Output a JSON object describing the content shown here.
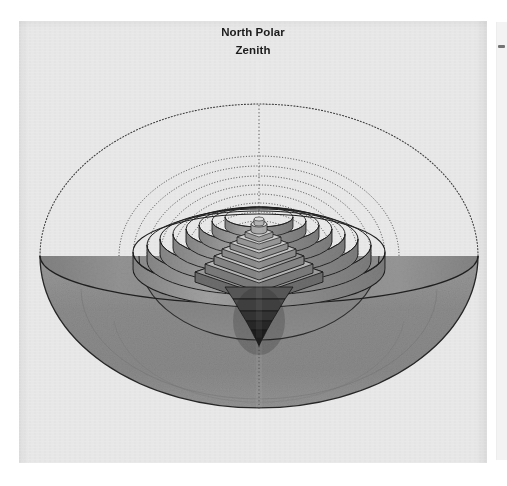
{
  "document": {
    "kind": "scanned-book-page",
    "page_background": "#e9e9e9",
    "ink_color": "#1c1c1c",
    "gutter_color": "#ffffff"
  },
  "caption": {
    "line1": "North Polar",
    "line2": "Zenith"
  },
  "figure": {
    "name": "north-polar-zenith-cosmological-diagram",
    "center_x": 240,
    "horizon_y": 235,
    "outer_sphere": {
      "rx": 219,
      "ry": 152,
      "stroke": "#2a2a2a",
      "style": "dotted",
      "label": "outer celestial sphere"
    },
    "horizon_plane": {
      "rx": 219,
      "ry": 48,
      "label": "horizon ellipse"
    },
    "lower_hemisphere": {
      "fill": "#8d8d8d",
      "label": "shaded lower hemisphere"
    },
    "inner_dome": {
      "rx": 120,
      "ry": 84,
      "fill": "#8a8a8a",
      "label": "inner hemispherical shell"
    },
    "zenith_axis": {
      "style": "dotted",
      "label": "vertical polar axis"
    },
    "concentric_shells": {
      "count": 10,
      "label": "concentric hemispherical shells",
      "radii_rx": [
        140,
        126,
        112,
        99,
        86,
        73,
        60,
        47,
        34,
        21
      ],
      "radii_ry": [
        100,
        90,
        80,
        71,
        62,
        53,
        44,
        35,
        25,
        16
      ]
    },
    "ring_terraces": {
      "count": 8,
      "label": "stacked circular terraces",
      "radii_rx": [
        126,
        112,
        99,
        86,
        73,
        60,
        47,
        34
      ]
    },
    "ziggurat": {
      "steps": 8,
      "label": "stepped pyramid at center",
      "cap": "cylindrical finial",
      "fill_light": "#cfcfcf",
      "fill_mid": "#9e9e9e",
      "fill_dark": "#6a6a6a"
    },
    "inverted_cone": {
      "steps": 6,
      "label": "inverted stepped cone below center",
      "fill": "#3a3a3a"
    }
  },
  "right_page": {
    "label": "adjacent page sliver",
    "mark": "ink-mark"
  }
}
